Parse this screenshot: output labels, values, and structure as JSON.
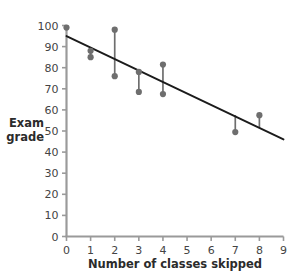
{
  "chart_data": {
    "type": "scatter",
    "title": "",
    "subtitle": "",
    "xlabel": "Number of classes skipped",
    "ylabel": "Exam grade",
    "ylabel_line1": "Exam",
    "ylabel_line2": "grade",
    "xlim": [
      0,
      9
    ],
    "ylim": [
      0,
      100
    ],
    "xticks": [
      0,
      1,
      2,
      3,
      4,
      5,
      6,
      7,
      8,
      9
    ],
    "yticks": [
      0,
      10,
      20,
      30,
      40,
      50,
      60,
      70,
      80,
      90,
      100
    ],
    "xtick_labels": [
      "0",
      "1",
      "2",
      "3",
      "4",
      "5",
      "6",
      "7",
      "8",
      "9"
    ],
    "ytick_labels": [
      "0",
      "10",
      "20",
      "30",
      "40",
      "50",
      "60",
      "70",
      "80",
      "90",
      "100"
    ],
    "grid": false,
    "legend": null,
    "points": [
      {
        "x": 0,
        "y": 99
      },
      {
        "x": 1,
        "y": 88
      },
      {
        "x": 1,
        "y": 85
      },
      {
        "x": 2,
        "y": 98
      },
      {
        "x": 2,
        "y": 76
      },
      {
        "x": 3,
        "y": 78
      },
      {
        "x": 3,
        "y": 68.5
      },
      {
        "x": 4,
        "y": 81.5
      },
      {
        "x": 4,
        "y": 67.5
      },
      {
        "x": 7,
        "y": 49.5
      },
      {
        "x": 8,
        "y": 57.5
      }
    ],
    "residual_lines": [
      {
        "x": 1,
        "y_point": 88,
        "y_fit": 85
      },
      {
        "x": 2,
        "y_point": 98,
        "y_fit": 76
      },
      {
        "x": 3,
        "y_point": 78,
        "y_fit": 68.5
      },
      {
        "x": 4,
        "y_point": 81.5,
        "y_fit": 67.5
      },
      {
        "x": 7,
        "y_point": 49.5,
        "y_fit": 57.5
      },
      {
        "x": 8,
        "y_point": 57.5,
        "y_fit": 51.5
      }
    ],
    "regression_line": {
      "x_start": 0,
      "y_start": 95,
      "x_end": 9,
      "y_end": 46,
      "slope": -5.44,
      "intercept": 95
    },
    "series": [
      {
        "name": "Exam grade",
        "x": [
          0,
          1,
          1,
          2,
          2,
          3,
          3,
          4,
          4,
          7,
          8
        ],
        "values": [
          99,
          88,
          85,
          98,
          76,
          78,
          68.5,
          81.5,
          67.5,
          49.5,
          57.5
        ]
      }
    ],
    "colors": {
      "point": "#6e6e6e",
      "residual": "#6e6e6e",
      "fit_line": "#1b1b1b",
      "axis": "#9a9a9a",
      "tick_text": "#444444",
      "label_text": "#2b2b2b",
      "background": "#ffffff"
    }
  }
}
